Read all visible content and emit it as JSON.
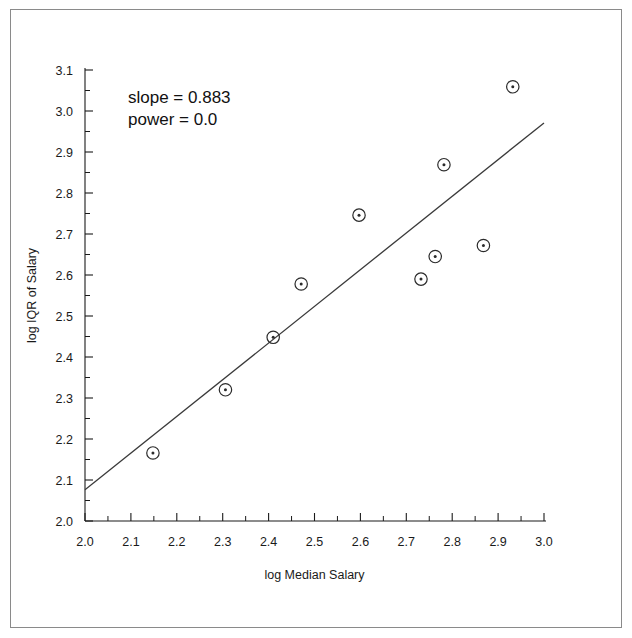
{
  "chart_data": {
    "type": "scatter",
    "title": "",
    "xlabel": "log Median Salary",
    "ylabel": "log IQR of Salary",
    "xlim": [
      2.0,
      3.0
    ],
    "ylim": [
      2.0,
      3.1
    ],
    "xticks": [
      "2.0",
      "2.1",
      "2.2",
      "2.3",
      "2.4",
      "2.5",
      "2.6",
      "2.7",
      "2.8",
      "2.9",
      "3.0"
    ],
    "yticks": [
      "2.0",
      "2.1",
      "2.2",
      "2.3",
      "2.4",
      "2.5",
      "2.6",
      "2.7",
      "2.8",
      "2.9",
      "3.0",
      "3.1"
    ],
    "xtick_values": [
      2.0,
      2.1,
      2.2,
      2.3,
      2.4,
      2.5,
      2.6,
      2.7,
      2.8,
      2.9,
      3.0
    ],
    "ytick_values": [
      2.0,
      2.1,
      2.2,
      2.3,
      2.4,
      2.5,
      2.6,
      2.7,
      2.8,
      2.9,
      3.0,
      3.1
    ],
    "minor_ticks_per_interval": 1,
    "grid": false,
    "legend": null,
    "points": [
      {
        "x": 2.148,
        "y": 2.166
      },
      {
        "x": 2.306,
        "y": 2.32
      },
      {
        "x": 2.41,
        "y": 2.448
      },
      {
        "x": 2.471,
        "y": 2.578
      },
      {
        "x": 2.597,
        "y": 2.746
      },
      {
        "x": 2.732,
        "y": 2.59
      },
      {
        "x": 2.763,
        "y": 2.645
      },
      {
        "x": 2.782,
        "y": 2.869
      },
      {
        "x": 2.868,
        "y": 2.672
      },
      {
        "x": 2.932,
        "y": 3.059
      }
    ],
    "fit_line": {
      "x_start": 2.0,
      "y_start": 2.076,
      "x_end": 3.0,
      "y_end": 2.971
    },
    "annotations": {
      "slope_label": "slope = 0.883",
      "power_label": "power =   0.0"
    },
    "colors": {
      "marker": "#2b2b2b",
      "line": "#3a3a3a",
      "axis": "#1a1a1a",
      "frame": "#8a8a8a",
      "background": "#ffffff"
    }
  }
}
